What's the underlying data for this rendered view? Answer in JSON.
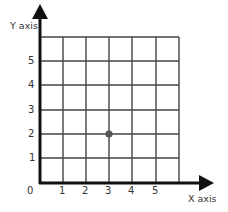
{
  "diagram": {
    "type": "coordinate-grid",
    "x_axis_label": "X axis",
    "y_axis_label": "Y axis",
    "origin_label": "0",
    "x_ticks": [
      "1",
      "2",
      "3",
      "4",
      "5"
    ],
    "y_ticks": [
      "1",
      "2",
      "3",
      "4",
      "5"
    ],
    "grid": {
      "columns": 6,
      "rows": 6
    },
    "points": [
      {
        "x": 3,
        "y": 2
      }
    ],
    "colors": {
      "axis": "#111111",
      "grid": "#444444",
      "point": "#555555",
      "text": "#333333"
    }
  }
}
